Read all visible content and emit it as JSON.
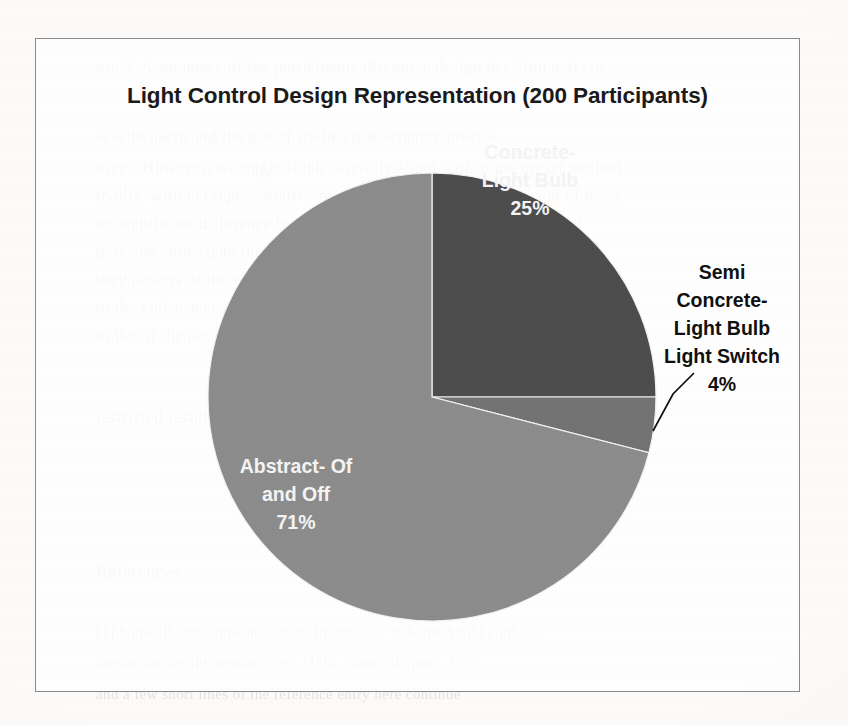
{
  "page": {
    "kind": "scanned-document-figure",
    "background_color": "#fcfbfa"
  },
  "chart_frame": {
    "border_color": "#8a8a8a"
  },
  "chart_data": {
    "type": "pie",
    "title": "Light Control Design Representation (200 Participants)",
    "total_participants": 200,
    "start_angle_deg": 0,
    "direction": "clockwise",
    "categories": [
      "Concrete- Light Bulb",
      "Semi Concrete- Light Bulb Light Switch",
      "Abstract- Of and Off"
    ],
    "values": [
      25,
      4,
      71
    ],
    "value_unit": "%",
    "colors": [
      "#4d4d4d",
      "#737373",
      "#8c8c8c"
    ],
    "legend": "none",
    "grid": false,
    "slices": [
      {
        "label_lines": [
          "Concrete-",
          "Light Bulb"
        ],
        "percent_text": "25%",
        "value": 25,
        "color": "#4d4d4d",
        "label_placement": "inside",
        "label_color": "#f4f4f4"
      },
      {
        "label_lines": [
          "Semi",
          "Concrete-",
          "Light Bulb",
          "Light Switch"
        ],
        "percent_text": "4%",
        "value": 4,
        "color": "#737373",
        "label_placement": "outside",
        "label_color": "#111111",
        "has_leader_line": true
      },
      {
        "label_lines": [
          "Abstract- Of",
          "and Off"
        ],
        "percent_text": "71%",
        "value": 71,
        "color": "#8c8c8c",
        "label_placement": "inside",
        "label_color": "#f4f4f4"
      }
    ]
  },
  "background_bleed": {
    "note": "faint show-through text from the reverse/adjacent page of the scan",
    "lines": [
      {
        "text": "ure 2. A summary of the participants discourse design decision makers",
        "x": 96,
        "y": 58,
        "italic": false,
        "size": 17
      },
      {
        "text": "w with users and the use of studies that separate precise",
        "x": 96,
        "y": 127,
        "italic": false,
        "size": 17
      },
      {
        "text": "users. However, we might think carefully about with some preset method",
        "x": 96,
        "y": 158,
        "italic": false,
        "size": 17
      },
      {
        "text": "inality, with (1) representative results of objects from proportion of users.",
        "x": 96,
        "y": 186,
        "italic": false,
        "size": 17
      },
      {
        "text": "no significant difference between the two groups separated. As well",
        "x": 96,
        "y": 214,
        "italic": false,
        "size": 17
      },
      {
        "text": "describe entire data the relative proportion with the accessibility of",
        "x": 96,
        "y": 242,
        "italic": false,
        "size": 17
      },
      {
        "text": "they objects of the elaborated on and different user interaction",
        "x": 96,
        "y": 270,
        "italic": false,
        "size": 17
      },
      {
        "text": "to the entire accessible of the use of the interaction result. Users",
        "x": 96,
        "y": 298,
        "italic": false,
        "size": 17
      },
      {
        "text": "in the of the objective at that the research interaction preset",
        "x": 96,
        "y": 326,
        "italic": false,
        "size": 17
      },
      {
        "text": "restricted result. The given and studies of accessibility to the users",
        "x": 96,
        "y": 408,
        "italic": false,
        "size": 17
      },
      {
        "text": "References",
        "x": 96,
        "y": 562,
        "italic": false,
        "size": 18
      },
      {
        "text": "[1] Some, P. and someone author. In: proc. of 'S Some AAAI conf. on",
        "x": 96,
        "y": 624,
        "italic": false,
        "size": 15
      },
      {
        "text": "Interaction design research. pp. 11-16. Some, In: proc. 1997.",
        "x": 96,
        "y": 654,
        "italic": false,
        "size": 15
      },
      {
        "text": "and a few short lines of the reference entry here continue",
        "x": 96,
        "y": 686,
        "italic": false,
        "size": 15
      }
    ]
  }
}
